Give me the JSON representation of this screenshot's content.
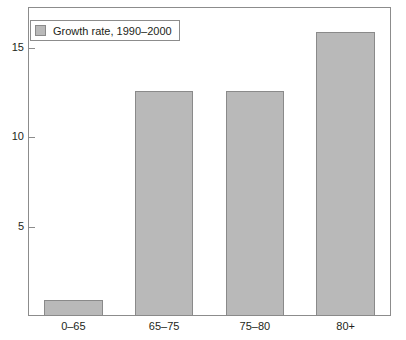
{
  "chart_data": {
    "type": "bar",
    "title": "",
    "subtitle": "",
    "xlabel": "",
    "ylabel": "",
    "categories": [
      "0–65",
      "65–75",
      "75–80",
      "80+"
    ],
    "values": [
      0.9,
      12.6,
      12.6,
      15.9
    ],
    "series": [
      {
        "name": "Growth rate, 1990–2000",
        "values": [
          0.9,
          12.6,
          12.6,
          15.9
        ],
        "color": "#b9b9b9"
      }
    ],
    "ylim": [
      0,
      17.3
    ],
    "yticks": [
      5,
      10,
      15
    ],
    "ytick_labels": [
      "5",
      "10",
      "15"
    ],
    "grid": false,
    "legend": {
      "position": "top-left",
      "entries": [
        {
          "label": "Growth rate, 1990–2000",
          "swatch_color": "#b9b9b9"
        }
      ]
    },
    "axis_color": "#8c8c8c",
    "text_color": "#231f20",
    "bar_fill": "#b9b9b9",
    "bar_edge": "#8a8a8a",
    "background": "#ffffff"
  }
}
